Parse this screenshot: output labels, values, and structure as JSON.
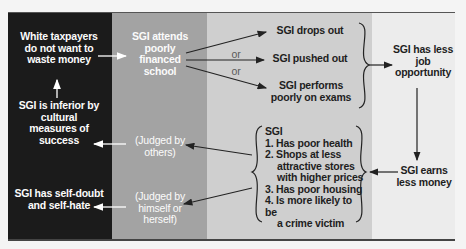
{
  "colors": {
    "panel_1": "#1b1b1b",
    "panel_2": "#a3a3a3",
    "panel_3": "#cfcfcf",
    "panel_4": "#ececec",
    "arrow_light": "#ffffff",
    "arrow_dark": "#222222"
  },
  "nodes": {
    "taxpayers": "White taxpayers do not want to waste money",
    "inferior": "SGI is inferior by cultural measures of success",
    "self_doubt": "SGI has self-doubt and self-hate",
    "school": "SGI attends poorly financed school",
    "judged_others": "(Judged by others)",
    "judged_self": "(Judged by himself or herself)",
    "drops_out": "SGI drops out",
    "pushed_out": "SGI pushed out",
    "performs_poorly": "SGI performs poorly on exams",
    "or_1": "or",
    "or_2": "or",
    "less_job": "SGI has less job opportunity",
    "earns_less": "SGI earns less money",
    "consequences": {
      "title": "SGI",
      "items": [
        "1. Has poor health",
        "2. Shops at less",
        "attractive stores",
        "with higher prices",
        "3. Has poor housing",
        "4. Is more likely to be",
        "a crime victim"
      ]
    }
  }
}
